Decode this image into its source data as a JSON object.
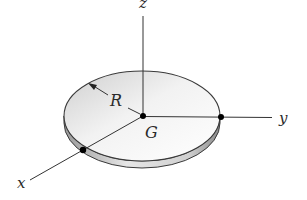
{
  "diagram": {
    "labels": {
      "z_axis": "z",
      "y_axis": "y",
      "x_axis": "x",
      "radius": "R",
      "center": "G"
    },
    "shape": "disk",
    "colors": {
      "line": "#333333",
      "disk_top_light": "#ffffff",
      "disk_top_dark": "#c8c8c8",
      "disk_rim": "#b5b5b5",
      "point": "#000000"
    }
  }
}
